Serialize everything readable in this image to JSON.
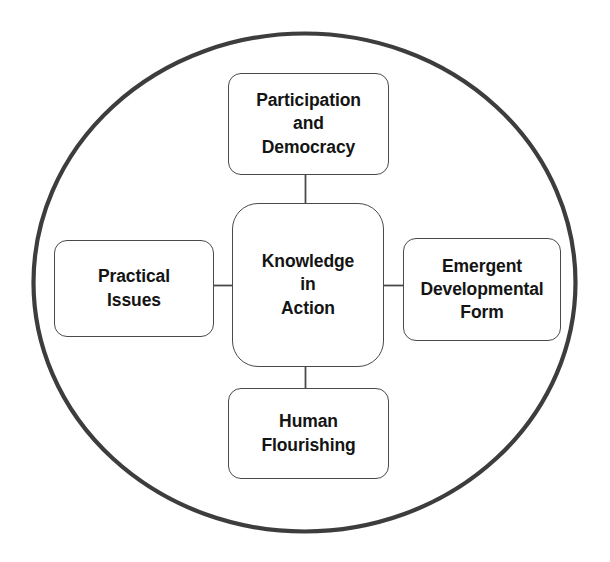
{
  "diagram": {
    "type": "concept-map",
    "title": "Knowledge in Action",
    "boundary": {
      "shape": "ellipse",
      "name": "outer-circle",
      "stroke_color": "#3d3d3d",
      "stroke_width": 4.2,
      "fill": "#ffffff",
      "cx": 304.5,
      "cy": 282.5,
      "rx": 272,
      "ry": 249
    },
    "style": {
      "node_stroke_color": "#4a4a4a",
      "node_fill": "#ffffff",
      "text_color": "#141414",
      "connector_color": "#4a4a4a",
      "background": "#ffffff"
    },
    "center": {
      "id": "knowledge-in-action",
      "label": "Knowledge\nin\nAction",
      "lines": [
        "Knowledge",
        "in",
        "Action"
      ]
    },
    "nodes": [
      {
        "id": "participation-and-democracy",
        "position": "top",
        "label": "Participation\nand\nDemocracy",
        "lines": [
          "Participation",
          "and",
          "Democracy"
        ]
      },
      {
        "id": "practical-issues",
        "position": "left",
        "label": "Practical\nIssues",
        "lines": [
          "Practical",
          "Issues"
        ]
      },
      {
        "id": "emergent-developmental-form",
        "position": "right",
        "label": "Emergent\nDevelopmental\nForm",
        "lines": [
          "Emergent",
          "Developmental",
          "Form"
        ]
      },
      {
        "id": "human-flourishing",
        "position": "bottom",
        "label": "Human\nFlourishing",
        "lines": [
          "Human",
          "Flourishing"
        ]
      }
    ],
    "connectors": [
      {
        "id": "connector-top",
        "from": "participation-and-democracy",
        "to": "knowledge-in-action",
        "orientation": "vertical"
      },
      {
        "id": "connector-left",
        "from": "practical-issues",
        "to": "knowledge-in-action",
        "orientation": "horizontal"
      },
      {
        "id": "connector-right",
        "from": "knowledge-in-action",
        "to": "emergent-developmental-form",
        "orientation": "horizontal"
      },
      {
        "id": "connector-bottom",
        "from": "knowledge-in-action",
        "to": "human-flourishing",
        "orientation": "vertical"
      }
    ]
  }
}
